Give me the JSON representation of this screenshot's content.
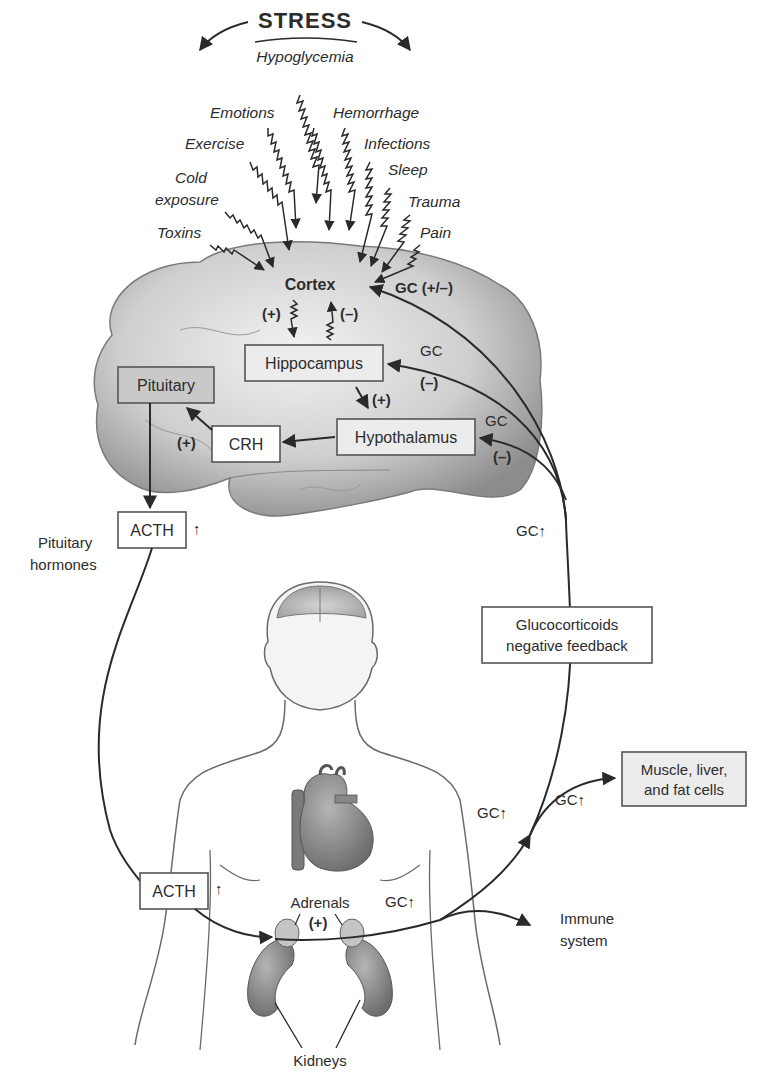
{
  "title": "STRESS",
  "stressors": {
    "hypoglycemia": "Hypoglycemia",
    "emotions": "Emotions",
    "hemorrhage": "Hemorrhage",
    "exercise": "Exercise",
    "infections": "Infections",
    "cold_1": "Cold",
    "cold_2": "exposure",
    "sleep": "Sleep",
    "trauma": "Trauma",
    "toxins": "Toxins",
    "pain": "Pain"
  },
  "brain": {
    "cortex": "Cortex",
    "cortex_to_hippo_sign": "(+)",
    "hippo_to_cortex_sign": "(–)",
    "hippocampus": "Hippocampus",
    "hippo_to_hypo_sign": "(+)",
    "hypothalamus": "Hypothalamus",
    "crh": "CRH",
    "crh_to_pituitary_sign": "(+)",
    "pituitary": "Pituitary"
  },
  "feedback": {
    "gc_cortex": "GC (+/–)",
    "gc_hippo": "GC",
    "gc_hippo_sign": "(–)",
    "gc_hypo": "GC",
    "gc_hypo_sign": "(–)",
    "gc_up": "GC↑",
    "box_line1": "Glucocorticoids",
    "box_line2": "negative feedback"
  },
  "pituitary_output": {
    "acth": "ACTH",
    "arrow": "↑",
    "label_1": "Pituitary",
    "label_2": "hormones"
  },
  "body": {
    "acth": "ACTH",
    "acth_arrow": "↑",
    "adrenals": "Adrenals",
    "adrenal_sign": "(+)",
    "kidneys": "Kidneys",
    "gc_adrenal": "GC↑",
    "gc_upward": "GC↑",
    "gc_muscle": "GC↑",
    "immune_1": "Immune",
    "immune_2": "system",
    "target_1": "Muscle, liver,",
    "target_2": "and fat cells"
  },
  "colors": {
    "brain_fill": "#bdbdbd",
    "box_gray": "#c9c9c9",
    "organ_fill": "#8a8a8a",
    "line": "#2a2a2a"
  }
}
